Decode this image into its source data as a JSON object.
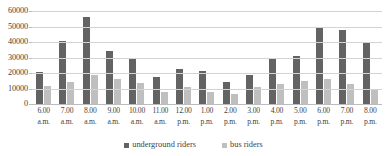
{
  "chart_data": {
    "type": "bar",
    "title": "",
    "xlabel": "",
    "ylabel": "",
    "ylim": [
      0,
      60000
    ],
    "ytick_values": [
      60000,
      50000,
      40000,
      30000,
      20000,
      10000,
      0
    ],
    "ytick_labels": [
      "60000",
      "50000",
      "40000",
      "30000",
      "20000",
      "10000",
      "0"
    ],
    "grid": true,
    "legend_position": "bottom",
    "categories": [
      "6.00 a.m.",
      "7.00 a.m.",
      "8.00 a.m.",
      "9.00 a.m.",
      "10.00 a.m.",
      "11.00 a.m.",
      "12.00 p.m.",
      "1.00 p.m.",
      "2.00 p.m.",
      "3.00 p.m.",
      "4.00 p.m.",
      "5.00 p.m.",
      "6.00 p.m.",
      "7.00 p.m.",
      "8.00 p.m."
    ],
    "category_lines": [
      {
        "hour": "6.00",
        "meridiem": "a.m."
      },
      {
        "hour": "7.00",
        "meridiem": "a.m."
      },
      {
        "hour": "8.00",
        "meridiem": "a.m."
      },
      {
        "hour": "9.00",
        "meridiem": "a.m."
      },
      {
        "hour": "10.00",
        "meridiem": "a.m."
      },
      {
        "hour": "11.00",
        "meridiem": "a.m."
      },
      {
        "hour": "12.00",
        "meridiem": "p.m."
      },
      {
        "hour": "1.00",
        "meridiem": "p.m."
      },
      {
        "hour": "2.00",
        "meridiem": "p.m."
      },
      {
        "hour": "3.00",
        "meridiem": "p.m."
      },
      {
        "hour": "4.00",
        "meridiem": "p.m."
      },
      {
        "hour": "5.00",
        "meridiem": "p.m."
      },
      {
        "hour": "6.00",
        "meridiem": "p.m."
      },
      {
        "hour": "7.00",
        "meridiem": "p.m."
      },
      {
        "hour": "8.00",
        "meridiem": "p.m."
      }
    ],
    "series": [
      {
        "name": "underground riders",
        "color": "#636363",
        "values": [
          20500,
          40500,
          56000,
          34000,
          29500,
          17500,
          22500,
          21500,
          14500,
          18500,
          29000,
          31000,
          49000,
          48000,
          40000
        ]
      },
      {
        "name": "bus riders",
        "color": "#bfbfbf",
        "values": [
          11500,
          14000,
          18500,
          16000,
          13500,
          7500,
          11000,
          7500,
          6500,
          11000,
          13000,
          15000,
          16000,
          13000,
          9500
        ]
      }
    ]
  },
  "legend": {
    "items": [
      {
        "label": "underground riders",
        "color": "#636363"
      },
      {
        "label": "bus riders",
        "color": "#bfbfbf"
      }
    ]
  },
  "colors": {
    "underground": "#636363",
    "bus": "#bfbfbf",
    "gridline": "#d3d3d3",
    "axis": "#bcbcbc",
    "text": "#3f3f3f"
  }
}
